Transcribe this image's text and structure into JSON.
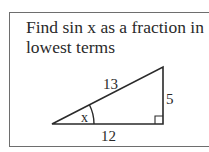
{
  "problem": {
    "prompt": "Find sin x as a fraction in lowest terms"
  },
  "figure": {
    "type": "right-triangle",
    "labels": {
      "hypotenuse": "13",
      "opposite": "5",
      "adjacent": "12",
      "angle": "x"
    },
    "right_angle_marker": true,
    "colors": {
      "stroke": "#2a2a2a",
      "border": "#6e6e6e",
      "background": "#ffffff"
    }
  }
}
